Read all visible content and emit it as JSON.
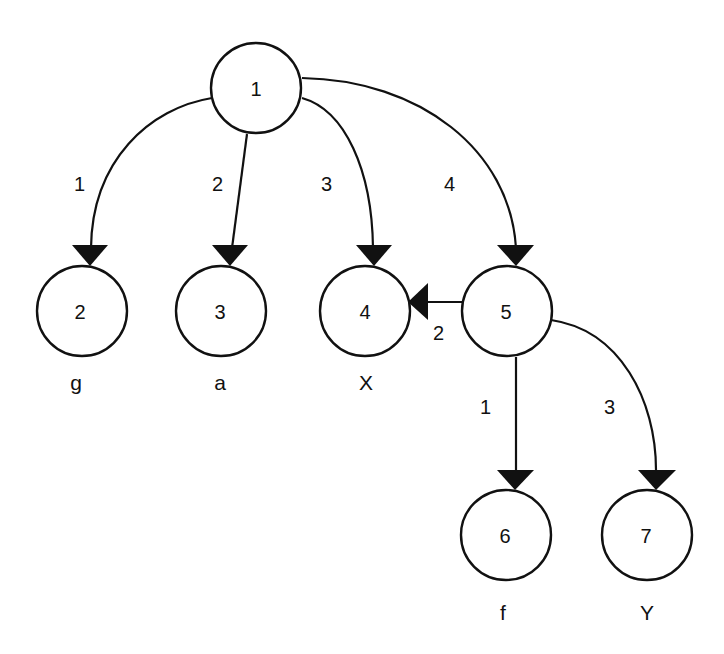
{
  "diagram": {
    "type": "tree",
    "nodes": [
      {
        "id": "1",
        "label": "1",
        "cx": 256,
        "cy": 90
      },
      {
        "id": "2",
        "label": "2",
        "cx": 82,
        "cy": 310,
        "leaf_label": "g"
      },
      {
        "id": "3",
        "label": "3",
        "cx": 221,
        "cy": 310,
        "leaf_label": "a"
      },
      {
        "id": "4",
        "label": "4",
        "cx": 365,
        "cy": 310,
        "leaf_label": "X"
      },
      {
        "id": "5",
        "label": "5",
        "cx": 507,
        "cy": 312
      },
      {
        "id": "6",
        "label": "6",
        "cx": 506,
        "cy": 536,
        "leaf_label": "f"
      },
      {
        "id": "7",
        "label": "7",
        "cx": 647,
        "cy": 536,
        "leaf_label": "Y"
      }
    ],
    "edges": [
      {
        "from": "1",
        "to": "2",
        "label": "1"
      },
      {
        "from": "1",
        "to": "3",
        "label": "2"
      },
      {
        "from": "1",
        "to": "4",
        "label": "3"
      },
      {
        "from": "1",
        "to": "5",
        "label": "4"
      },
      {
        "from": "5",
        "to": "4",
        "label": "2"
      },
      {
        "from": "5",
        "to": "6",
        "label": "1"
      },
      {
        "from": "5",
        "to": "7",
        "label": "3"
      }
    ]
  }
}
